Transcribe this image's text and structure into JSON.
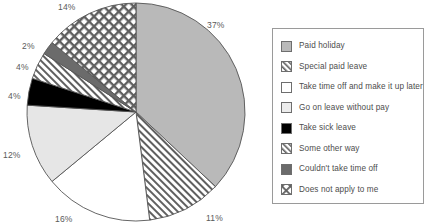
{
  "chart_data": {
    "type": "pie",
    "title": "",
    "subtitle": "",
    "xlabel": "",
    "ylabel": "",
    "grid": false,
    "legend_position": "right",
    "start_angle_deg": 0,
    "direction": "clockwise",
    "categories": [
      "Paid holiday",
      "Special paid leave",
      "Take time off and make it up later",
      "Go on leave without pay",
      "Take sick leave",
      "Some other way",
      "Couldn't take time off",
      "Does not apply to me"
    ],
    "values": [
      37,
      11,
      16,
      12,
      4,
      4,
      2,
      14
    ],
    "data_labels": [
      "37%",
      "11%",
      "16%",
      "12%",
      "4%",
      "4%",
      "2%",
      "14%"
    ],
    "slices": [
      {
        "label": "Paid holiday",
        "value": 37,
        "data_label": "37%",
        "fill": "#b9b9b9",
        "pattern": "solid",
        "label_x": 207,
        "label_y": 20
      },
      {
        "label": "Special paid leave",
        "value": 11,
        "data_label": "11%",
        "fill": "#ffffff",
        "pattern": "diagonal",
        "label_x": 206,
        "label_y": 213
      },
      {
        "label": "Take time off and make it up later",
        "value": 16,
        "data_label": "16%",
        "fill": "#ffffff",
        "pattern": "solid",
        "label_x": 55,
        "label_y": 214
      },
      {
        "label": "Go on leave without pay",
        "value": 12,
        "data_label": "12%",
        "fill": "#e6e6e6",
        "pattern": "solid",
        "label_x": 3,
        "label_y": 150
      },
      {
        "label": "Take sick leave",
        "value": 4,
        "data_label": "4%",
        "fill": "#000000",
        "pattern": "solid",
        "label_x": 8,
        "label_y": 91
      },
      {
        "label": "Some other way",
        "value": 4,
        "data_label": "4%",
        "fill": "#ffffff",
        "pattern": "diagonal",
        "label_x": 16,
        "label_y": 62
      },
      {
        "label": "Couldn't take time off",
        "value": 2,
        "data_label": "2%",
        "fill": "#6b6b6b",
        "pattern": "solid",
        "label_x": 22,
        "label_y": 41
      },
      {
        "label": "Does not apply to me",
        "value": 14,
        "data_label": "14%",
        "fill": "#ffffff",
        "pattern": "crosshatch",
        "label_x": 58,
        "label_y": 2
      }
    ]
  },
  "legend": {
    "items": [
      {
        "label": "Paid holiday",
        "fill": "#b9b9b9",
        "pattern": "solid"
      },
      {
        "label": "Special paid leave",
        "fill": "#ffffff",
        "pattern": "diagonal"
      },
      {
        "label": "Take time off and make it up later",
        "fill": "#ffffff",
        "pattern": "solid"
      },
      {
        "label": "Go on leave without pay",
        "fill": "#ececec",
        "pattern": "solid"
      },
      {
        "label": "Take sick leave",
        "fill": "#000000",
        "pattern": "solid"
      },
      {
        "label": "Some other way",
        "fill": "#ffffff",
        "pattern": "diagonal"
      },
      {
        "label": "Couldn't take time off",
        "fill": "#6b6b6b",
        "pattern": "solid"
      },
      {
        "label": "Does not apply to me",
        "fill": "#ffffff",
        "pattern": "crosshatch"
      }
    ]
  },
  "geometry": {
    "center_x": 136,
    "center_y": 112,
    "radius": 109
  },
  "colors": {
    "slice_stroke": "#555555",
    "legend_border": "#9a9a9a",
    "label_text": "#5a5a5a"
  }
}
